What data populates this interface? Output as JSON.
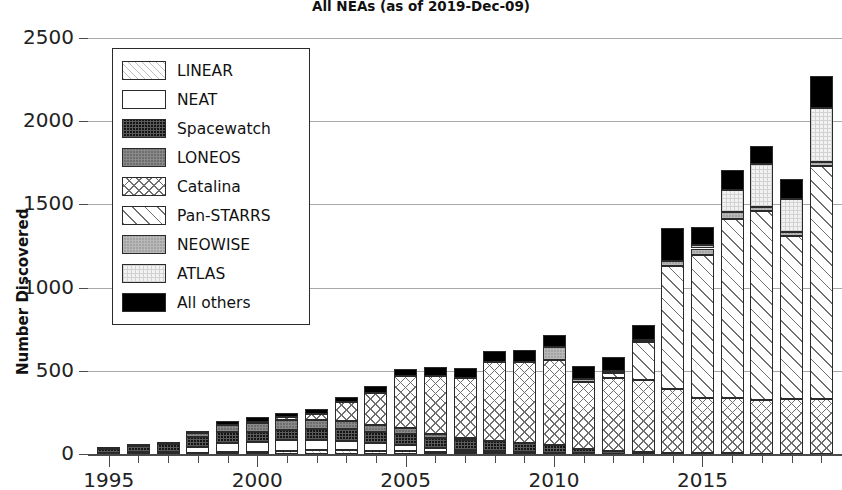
{
  "chart_data": {
    "type": "bar",
    "subtype": "stacked-bar",
    "title": "All NEAs (as of 2019-Dec-09)",
    "xlabel": "",
    "ylabel": "Number Discovered",
    "ylim": [
      0,
      2600
    ],
    "yticks": [
      0,
      500,
      1000,
      1500,
      2000,
      2500
    ],
    "ytick_labels": [
      "0",
      "500",
      "1000",
      "1500",
      "2000",
      "2500"
    ],
    "xticks": [
      1995,
      2000,
      2005,
      2010,
      2015
    ],
    "xtick_labels": [
      "1995",
      "2000",
      "2005",
      "2010",
      "2015"
    ],
    "xlim": [
      1994.3,
      2019.7
    ],
    "grid": "horizontal",
    "legend_position": "upper-left-inside",
    "categories": [
      1995,
      1996,
      1997,
      1998,
      1999,
      2000,
      2001,
      2002,
      2003,
      2004,
      2005,
      2006,
      2007,
      2008,
      2009,
      2010,
      2011,
      2012,
      2013,
      2014,
      2015,
      2016,
      2017,
      2018,
      2019
    ],
    "series": [
      {
        "name": "LINEAR",
        "pattern": "diagonal-fine-hatch",
        "values": [
          0,
          0,
          0,
          6,
          11,
          14,
          19,
          22,
          24,
          20,
          17,
          14,
          10,
          9,
          7,
          5,
          3,
          2,
          1,
          1,
          0,
          0,
          0,
          0,
          0
        ]
      },
      {
        "name": "NEAT",
        "pattern": "solid-white",
        "values": [
          7,
          12,
          12,
          38,
          55,
          60,
          66,
          62,
          56,
          48,
          36,
          24,
          14,
          9,
          6,
          4,
          2,
          1,
          1,
          0,
          0,
          0,
          0,
          0,
          0
        ]
      },
      {
        "name": "Spacewatch",
        "pattern": "dense-dark-grid",
        "values": [
          22,
          38,
          46,
          60,
          66,
          60,
          62,
          64,
          68,
          62,
          70,
          60,
          62,
          58,
          52,
          44,
          26,
          14,
          12,
          8,
          5,
          4,
          3,
          2,
          2
        ]
      },
      {
        "name": "LONEOS",
        "pattern": "gray-grid",
        "values": [
          0,
          0,
          0,
          22,
          44,
          52,
          56,
          58,
          52,
          46,
          34,
          22,
          12,
          4,
          0,
          0,
          0,
          0,
          0,
          0,
          0,
          0,
          0,
          0,
          0
        ]
      },
      {
        "name": "Catalina",
        "pattern": "cross-hatch",
        "values": [
          0,
          0,
          0,
          0,
          0,
          8,
          18,
          32,
          110,
          190,
          310,
          350,
          360,
          470,
          490,
          510,
          400,
          440,
          430,
          380,
          330,
          330,
          320,
          330,
          330
        ]
      },
      {
        "name": "Pan-STARRS",
        "pattern": "wide-diagonal-hatch",
        "values": [
          0,
          0,
          0,
          0,
          0,
          0,
          0,
          0,
          0,
          0,
          0,
          0,
          0,
          0,
          0,
          0,
          0,
          30,
          230,
          740,
          860,
          1080,
          1140,
          980,
          1400
        ]
      },
      {
        "name": "NEOWISE",
        "pattern": "light-gray-grid",
        "values": [
          0,
          0,
          0,
          0,
          0,
          0,
          0,
          0,
          0,
          0,
          0,
          0,
          0,
          0,
          0,
          80,
          20,
          10,
          10,
          30,
          40,
          40,
          20,
          20,
          20
        ]
      },
      {
        "name": "ATLAS",
        "pattern": "very-light-grid",
        "values": [
          0,
          0,
          0,
          0,
          0,
          0,
          0,
          0,
          0,
          0,
          0,
          0,
          0,
          0,
          0,
          0,
          0,
          0,
          0,
          0,
          20,
          130,
          260,
          200,
          330
        ]
      },
      {
        "name": "All others",
        "pattern": "solid-black",
        "values": [
          4,
          6,
          8,
          14,
          24,
          26,
          28,
          32,
          34,
          40,
          46,
          52,
          60,
          68,
          70,
          72,
          78,
          88,
          94,
          200,
          110,
          120,
          110,
          120,
          190
        ]
      }
    ],
    "totals": [
      33,
      56,
      66,
      140,
      200,
      220,
      249,
      270,
      344,
      406,
      513,
      522,
      518,
      618,
      625,
      715,
      529,
      585,
      778,
      1359,
      1365,
      1704,
      1853,
      1652,
      2272
    ]
  },
  "legend": {
    "entries": [
      {
        "label": "LINEAR",
        "pattern_class": "p-linear"
      },
      {
        "label": "NEAT",
        "pattern_class": "p-neat"
      },
      {
        "label": "Spacewatch",
        "pattern_class": "p-spacewatch"
      },
      {
        "label": "LONEOS",
        "pattern_class": "p-loneos"
      },
      {
        "label": "Catalina",
        "pattern_class": "p-catalina"
      },
      {
        "label": "Pan-STARRS",
        "pattern_class": "p-panstarrs"
      },
      {
        "label": "NEOWISE",
        "pattern_class": "p-neowise"
      },
      {
        "label": "ATLAS",
        "pattern_class": "p-atlas"
      },
      {
        "label": "All others",
        "pattern_class": "p-allothers"
      }
    ]
  },
  "colors": {
    "gridline": "#a8a8a8",
    "axis": "#4a4a4a",
    "text": "#111111",
    "background": "#ffffff"
  }
}
